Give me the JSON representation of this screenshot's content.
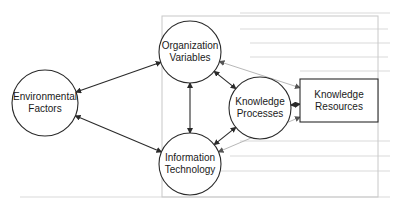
{
  "diagram": {
    "nodes": [
      {
        "id": "env",
        "shape": "circle",
        "cx": 45,
        "cy": 103,
        "r": 33,
        "lines": [
          "Environmental",
          "Factors"
        ]
      },
      {
        "id": "org",
        "shape": "circle",
        "cx": 190,
        "cy": 52,
        "r": 31,
        "lines": [
          "Organization",
          "Variables"
        ]
      },
      {
        "id": "it",
        "shape": "circle",
        "cx": 190,
        "cy": 164,
        "r": 31,
        "lines": [
          "Information",
          "Technology"
        ]
      },
      {
        "id": "kp",
        "shape": "circle",
        "cx": 260,
        "cy": 108,
        "r": 31,
        "lines": [
          "Knowledge",
          "Processes"
        ]
      },
      {
        "id": "kr",
        "shape": "rect",
        "x": 300,
        "y": 79,
        "w": 78,
        "h": 43,
        "lines": [
          "Knowledge",
          "Resources"
        ]
      }
    ],
    "frame": {
      "x": 162,
      "y": 16,
      "w": 216,
      "h": 181
    },
    "edges": [
      {
        "from": "env",
        "to": "org",
        "style": "dark",
        "bidirectional": true
      },
      {
        "from": "env",
        "to": "it",
        "style": "dark",
        "bidirectional": true
      },
      {
        "from": "org",
        "to": "it",
        "style": "dark",
        "bidirectional": true
      },
      {
        "from": "org",
        "to": "kp",
        "style": "dark",
        "bidirectional": true
      },
      {
        "from": "it",
        "to": "kp",
        "style": "dark",
        "bidirectional": true
      },
      {
        "from": "kp",
        "to": "kr",
        "style": "dark",
        "bidirectional": true
      },
      {
        "from": "kr",
        "to": "org",
        "style": "light",
        "bidirectional": true
      },
      {
        "from": "kr",
        "to": "it",
        "style": "light",
        "bidirectional": true
      }
    ],
    "colors": {
      "stroke": "#2a2a2a",
      "light_stroke": "#b8b8b8",
      "frame": "#c8c8c8",
      "background": "#ffffff"
    }
  }
}
